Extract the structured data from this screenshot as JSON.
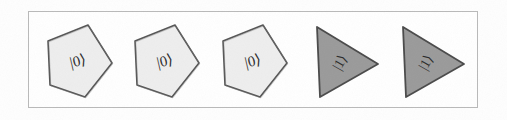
{
  "figure": {
    "background_color": "#fefefe",
    "frame_color": "#b9b9b9",
    "frame": {
      "x": 28,
      "y": 11,
      "width": 450,
      "height": 97
    }
  },
  "palette": {
    "pentagon_fill": "#eeeeee",
    "pentagon_stroke": "#555555",
    "triangle_fill": "#9a9a9a",
    "triangle_stroke": "#4a4a4a",
    "label_color": "#2b2b2b",
    "page_background": "#ffffff"
  },
  "shapes": [
    {
      "index": 1,
      "kind": "pentagon",
      "state": "|0⟩",
      "fill": "#eeeeee",
      "stroke": "#555555",
      "x": 8,
      "rotation": -13
    },
    {
      "index": 2,
      "kind": "pentagon",
      "state": "|0⟩",
      "fill": "#eeeeee",
      "stroke": "#555555",
      "x": 95,
      "rotation": -13
    },
    {
      "index": 3,
      "kind": "pentagon",
      "state": "|0⟩",
      "fill": "#eeeeee",
      "stroke": "#555555",
      "x": 183,
      "rotation": -13
    },
    {
      "index": 4,
      "kind": "triangle",
      "state": "|1⟩",
      "fill": "#9a9a9a",
      "stroke": "#4a4a4a",
      "x": 272,
      "rotation": -60
    },
    {
      "index": 5,
      "kind": "triangle",
      "state": "|1⟩",
      "fill": "#9a9a9a",
      "stroke": "#4a4a4a",
      "x": 358,
      "rotation": -60
    }
  ]
}
